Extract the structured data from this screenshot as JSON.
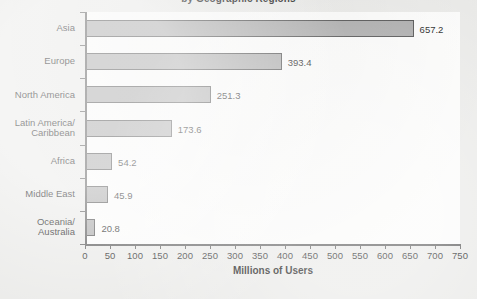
{
  "chart_data": {
    "type": "bar",
    "orientation": "horizontal",
    "title": "by Geographic Regions",
    "title_note": "clipped at top edge of screenshot",
    "xlabel": "Millions of Users",
    "ylabel": "",
    "xlim": [
      0,
      750
    ],
    "xticks": [
      0,
      50,
      100,
      150,
      200,
      250,
      300,
      350,
      400,
      450,
      500,
      550,
      600,
      650,
      700,
      750
    ],
    "grid": false,
    "legend": false,
    "categories": [
      "Asia",
      "Europe",
      "North America",
      "Latin America/\nCaribbean",
      "Africa",
      "Middle East",
      "Oceania/\nAustralia"
    ],
    "values": [
      657.2,
      393.4,
      251.3,
      173.6,
      54.2,
      45.9,
      20.8
    ],
    "value_labels": [
      "657.2",
      "393.4",
      "251.3",
      "173.6",
      "54.2",
      "45.9",
      "20.8"
    ],
    "colors": {
      "bar_fill": "#a9a9a9",
      "bar_border": "#4a4a4a",
      "axis": "#555555",
      "text": "#111111",
      "plot_background": "#fbfbfa",
      "page_background": "#e9e9e7"
    }
  }
}
